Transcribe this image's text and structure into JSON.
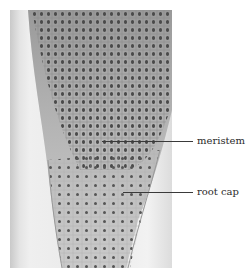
{
  "figure": {
    "type": "micrograph",
    "labels": [
      {
        "text": "meristem"
      },
      {
        "text": "root cap"
      }
    ]
  }
}
